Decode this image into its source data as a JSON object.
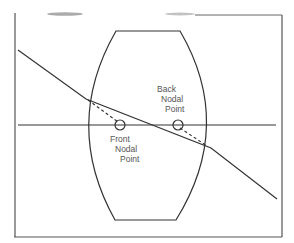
{
  "diagram": {
    "type": "lens-nodal-points",
    "labels": {
      "back": [
        "Back",
        "Nodal",
        "Point"
      ],
      "front": [
        "Front",
        "Nodal",
        "Point"
      ]
    },
    "colors": {
      "line": "#333333",
      "text": "#555555",
      "background": "#ffffff"
    }
  }
}
